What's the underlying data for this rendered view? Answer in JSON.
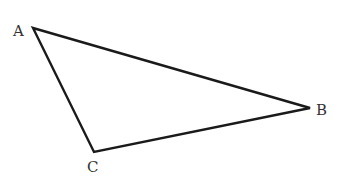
{
  "diagram": {
    "type": "triangle",
    "vertices": [
      {
        "id": "A",
        "label": "A",
        "x": 33,
        "y": 28,
        "label_x": 13,
        "label_y": 36
      },
      {
        "id": "B",
        "label": "B",
        "x": 310,
        "y": 108,
        "label_x": 316,
        "label_y": 115
      },
      {
        "id": "C",
        "label": "C",
        "x": 94,
        "y": 152,
        "label_x": 87,
        "label_y": 172
      }
    ],
    "edges": [
      {
        "from": "A",
        "to": "B"
      },
      {
        "from": "B",
        "to": "C"
      },
      {
        "from": "C",
        "to": "A"
      }
    ],
    "stroke_color": "#1a1a1a",
    "label_color": "#333333"
  }
}
